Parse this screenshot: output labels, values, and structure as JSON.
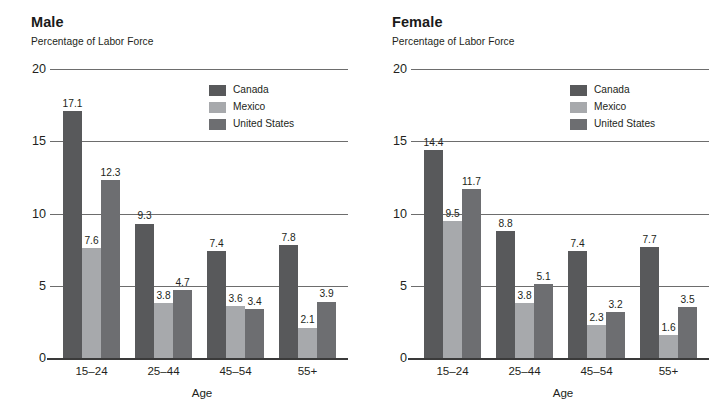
{
  "chart_data": [
    {
      "type": "bar",
      "title": "Male",
      "subtitle": "Percentage of Labor Force",
      "xlabel": "Age",
      "ylabel": "",
      "ylim": [
        0,
        20
      ],
      "yticks": [
        0,
        5,
        10,
        15,
        20
      ],
      "ytick_labels": [
        "0",
        "5",
        "10",
        "15",
        "20"
      ],
      "grid": true,
      "legend_position": "top-right",
      "categories": [
        "15–24",
        "25–44",
        "45–54",
        "55+"
      ],
      "series": [
        {
          "name": "Canada",
          "color": "#58595b",
          "values": [
            17.1,
            9.3,
            7.4,
            7.8
          ]
        },
        {
          "name": "Mexico",
          "color": "#a7a9ac",
          "values": [
            7.6,
            3.8,
            3.6,
            2.1
          ]
        },
        {
          "name": "United States",
          "color": "#6d6e71",
          "values": [
            12.3,
            4.7,
            3.4,
            3.9
          ]
        }
      ],
      "data_labels": [
        [
          "17.1",
          "9.3",
          "7.4",
          "7.8"
        ],
        [
          "7.6",
          "3.8",
          "3.6",
          "2.1"
        ],
        [
          "12.3",
          "4.7",
          "3.4",
          "3.9"
        ]
      ]
    },
    {
      "type": "bar",
      "title": "Female",
      "subtitle": "Percentage of Labor Force",
      "xlabel": "Age",
      "ylabel": "",
      "ylim": [
        0,
        20
      ],
      "yticks": [
        0,
        5,
        10,
        15,
        20
      ],
      "ytick_labels": [
        "0",
        "5",
        "10",
        "15",
        "20"
      ],
      "grid": true,
      "legend_position": "top-right",
      "categories": [
        "15–24",
        "25–44",
        "45–54",
        "55+"
      ],
      "series": [
        {
          "name": "Canada",
          "color": "#58595b",
          "values": [
            14.4,
            8.8,
            7.4,
            7.7
          ]
        },
        {
          "name": "Mexico",
          "color": "#a7a9ac",
          "values": [
            9.5,
            3.8,
            2.3,
            1.6
          ]
        },
        {
          "name": "United States",
          "color": "#6d6e71",
          "values": [
            11.7,
            5.1,
            3.2,
            3.5
          ]
        }
      ],
      "data_labels": [
        [
          "14.4",
          "8.8",
          "7.4",
          "7.7"
        ],
        [
          "9.5",
          "3.8",
          "2.3",
          "1.6"
        ],
        [
          "11.7",
          "5.1",
          "3.2",
          "3.5"
        ]
      ]
    }
  ]
}
